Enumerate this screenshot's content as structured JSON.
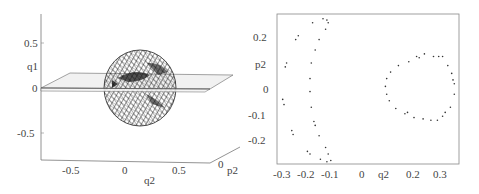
{
  "figure": {
    "left_panel": {
      "type": "3d-surface",
      "description": "Torus-like wireframe invariant surface intersected by plane q1=0",
      "vertical_axis": {
        "label": "q1",
        "ticks": [
          "0.5",
          "0",
          "-0.5"
        ]
      },
      "horizontal_axis": {
        "label": "q2",
        "ticks": [
          "-0.5",
          "0",
          "0.5"
        ]
      },
      "depth_axis": {
        "label": "p2",
        "ticks": [
          "0"
        ]
      }
    },
    "right_panel": {
      "type": "scatter",
      "xlabel": "q2",
      "ylabel": "p2",
      "x_ticks": [
        "-0.3",
        "-0.2",
        "-0.1",
        "0",
        "0.2",
        "0.3"
      ],
      "y_ticks": [
        "0.2",
        "0",
        "-0.1",
        "-0.2"
      ]
    }
  },
  "chart_data": [
    {
      "type": "surface3d",
      "title": "",
      "axes": {
        "x": "q2",
        "y": "p2",
        "z": "q1"
      },
      "x_ticks": [
        -0.5,
        0,
        0.5
      ],
      "z_ticks": [
        -0.5,
        0,
        0.5
      ],
      "y_ticks": [
        0
      ],
      "plane": "q1 = 0"
    },
    {
      "type": "scatter",
      "title": "",
      "xlabel": "q2",
      "ylabel": "p2",
      "xlim": [
        -0.32,
        0.37
      ],
      "ylim": [
        -0.29,
        0.28
      ],
      "grid": false,
      "series": [
        {
          "name": "outer island chain",
          "points": [
            [
              -0.15,
              0.27
            ],
            [
              -0.135,
              0.265
            ],
            [
              -0.13,
              0.255
            ],
            [
              -0.19,
              0.255
            ],
            [
              -0.14,
              0.23
            ],
            [
              -0.165,
              0.19
            ],
            [
              -0.18,
              0.15
            ],
            [
              -0.195,
              0.1
            ],
            [
              -0.2,
              0.04
            ],
            [
              -0.2,
              -0.01
            ],
            [
              -0.195,
              -0.07
            ],
            [
              -0.185,
              -0.125
            ],
            [
              -0.18,
              -0.14
            ],
            [
              -0.165,
              -0.18
            ],
            [
              -0.14,
              -0.225
            ],
            [
              -0.13,
              -0.25
            ],
            [
              -0.21,
              -0.24
            ],
            [
              -0.2,
              -0.25
            ],
            [
              -0.16,
              -0.27
            ],
            [
              -0.135,
              -0.28
            ],
            [
              -0.12,
              -0.275
            ],
            [
              -0.245,
              0.205
            ],
            [
              -0.255,
              0.19
            ],
            [
              -0.29,
              0.1
            ],
            [
              -0.295,
              0.085
            ],
            [
              -0.305,
              -0.04
            ],
            [
              -0.3,
              -0.06
            ],
            [
              -0.27,
              -0.16
            ],
            [
              -0.265,
              -0.175
            ]
          ]
        },
        {
          "name": "inner invariant curve",
          "points": [
            [
              0.24,
              0.135
            ],
            [
              0.275,
              0.125
            ],
            [
              0.295,
              0.125
            ],
            [
              0.21,
              0.125
            ],
            [
              0.22,
              0.12
            ],
            [
              0.18,
              0.105
            ],
            [
              0.14,
              0.09
            ],
            [
              0.11,
              0.065
            ],
            [
              0.095,
              0.04
            ],
            [
              0.09,
              0.01
            ],
            [
              0.095,
              -0.02
            ],
            [
              0.105,
              -0.045
            ],
            [
              0.13,
              -0.075
            ],
            [
              0.165,
              -0.095
            ],
            [
              0.175,
              -0.09
            ],
            [
              0.2,
              -0.11
            ],
            [
              0.235,
              -0.115
            ],
            [
              0.265,
              -0.12
            ],
            [
              0.29,
              -0.12
            ],
            [
              0.31,
              -0.105
            ],
            [
              0.32,
              -0.09
            ],
            [
              0.34,
              -0.07
            ],
            [
              0.355,
              -0.02
            ],
            [
              0.355,
              0.02
            ],
            [
              0.35,
              0.035
            ],
            [
              0.345,
              0.06
            ],
            [
              0.33,
              0.09
            ],
            [
              0.31,
              0.125
            ]
          ]
        }
      ]
    }
  ]
}
